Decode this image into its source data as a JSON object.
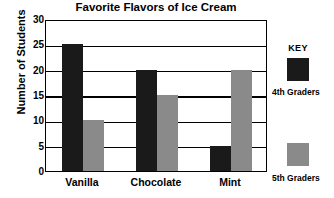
{
  "chart_data": {
    "type": "bar",
    "title": "Favorite Flavors of Ice Cream",
    "xlabel": "",
    "ylabel": "Number of Students",
    "categories": [
      "Vanilla",
      "Chocolate",
      "Mint"
    ],
    "series": [
      {
        "name": "4th Graders",
        "color": "#1a1a1a",
        "values": [
          25,
          20,
          5
        ]
      },
      {
        "name": "5th Graders",
        "color": "#8a8a8a",
        "values": [
          10,
          15,
          20
        ]
      }
    ],
    "ylim": [
      0,
      30
    ],
    "yticks": [
      30,
      25,
      20,
      15,
      10,
      5,
      0
    ],
    "grid": true,
    "legend_position": "right"
  },
  "legend": {
    "title": "KEY",
    "entries": [
      {
        "label": "4th Graders",
        "color": "#1a1a1a"
      },
      {
        "label": "5th Graders",
        "color": "#8a8a8a"
      }
    ]
  },
  "axis": {
    "y_title": "Number of Students",
    "y_tick_labels": [
      "30",
      "25",
      "20",
      "15",
      "10",
      "5",
      "0"
    ],
    "x_tick_labels": [
      "Vanilla",
      "Chocolate",
      "Mint"
    ]
  },
  "colors": {
    "series_4th": "#1a1a1a",
    "series_5th": "#8a8a8a",
    "axis": "#000000",
    "background": "#ffffff"
  }
}
